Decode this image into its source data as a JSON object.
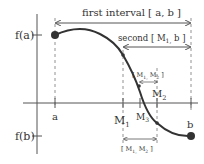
{
  "diagram": {
    "labels": {
      "fa": "f(a)",
      "fb": "f(b)",
      "a": "a",
      "b": "b",
      "M1": "M",
      "M1_sub": "1",
      "M2": "M",
      "M2_sub": "2",
      "M3": "M",
      "M3_sub": "3"
    },
    "intervals": {
      "first": "first interval  [ a, b ]",
      "second": "second  [ M",
      "second_sub": "1,",
      "second_end": " b ]",
      "third_top": "[ M",
      "third_top_sub": "1,",
      "third_top_mid": " M",
      "third_top_sub2": "2",
      "third_top_end": " ]",
      "third_bottom": "[ M",
      "third_bottom_sub": "1,",
      "third_bottom_mid": " M",
      "third_bottom_sub2": "2",
      "third_bottom_end": " ]"
    },
    "colors": {
      "curve": "#333333",
      "axis": "#555555",
      "dashed": "#777777",
      "point": "#333333"
    }
  }
}
